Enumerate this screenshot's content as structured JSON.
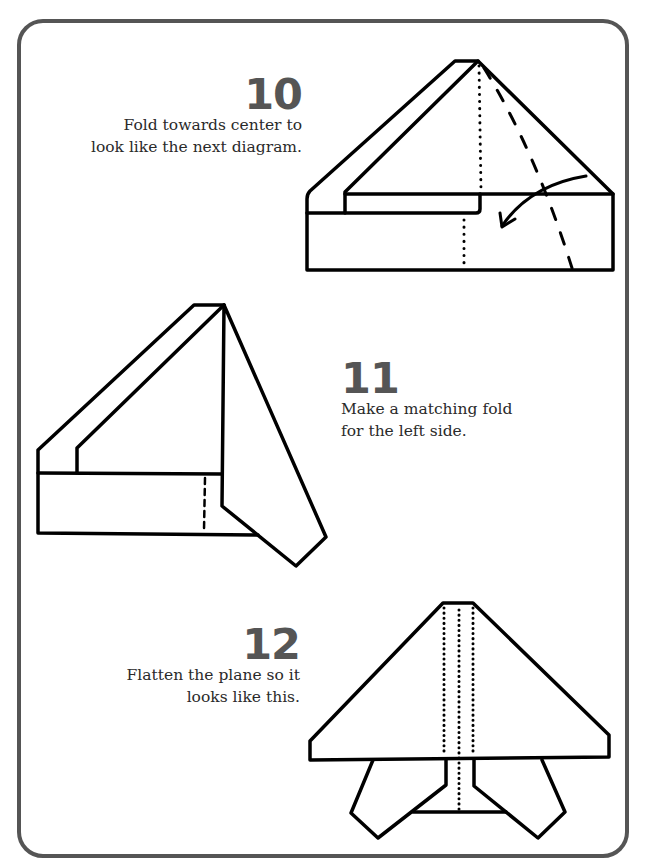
{
  "page": {
    "border_color": "#555555",
    "line_color": "#000000",
    "number_color": "#555555"
  },
  "steps": [
    {
      "number": "10",
      "text_lines": [
        "Fold towards center to",
        "look like the next diagram."
      ],
      "diagram": "partially-folded-plane-with-fold-guide-and-arrow",
      "icons": [
        "dotted-center-line",
        "dashed-fold-line",
        "curved-fold-arrow"
      ]
    },
    {
      "number": "11",
      "text_lines": [
        "Make a matching fold",
        "for the left side."
      ],
      "diagram": "plane-with-right-side-folded",
      "icons": [
        "dashed-line"
      ]
    },
    {
      "number": "12",
      "text_lines": [
        "Flatten the plane so it",
        "looks like this."
      ],
      "diagram": "finished-flattened-plane",
      "icons": [
        "dotted-fold-lines"
      ]
    }
  ]
}
